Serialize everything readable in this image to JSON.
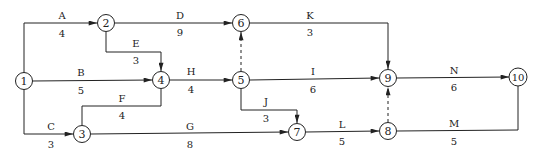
{
  "diagram": {
    "type": "activity-on-arrow network",
    "nodes": [
      {
        "id": "1",
        "x": 24,
        "y": 81
      },
      {
        "id": "2",
        "x": 106,
        "y": 23
      },
      {
        "id": "3",
        "x": 82,
        "y": 134
      },
      {
        "id": "4",
        "x": 161,
        "y": 80
      },
      {
        "id": "5",
        "x": 241,
        "y": 80
      },
      {
        "id": "6",
        "x": 241,
        "y": 23
      },
      {
        "id": "7",
        "x": 297,
        "y": 132
      },
      {
        "id": "8",
        "x": 388,
        "y": 131
      },
      {
        "id": "9",
        "x": 388,
        "y": 78
      },
      {
        "id": "10",
        "x": 518,
        "y": 77
      }
    ],
    "activities": [
      {
        "name": "A",
        "duration": "4",
        "from": "1",
        "to": "2"
      },
      {
        "name": "B",
        "duration": "5",
        "from": "1",
        "to": "4"
      },
      {
        "name": "C",
        "duration": "3",
        "from": "1",
        "to": "3"
      },
      {
        "name": "D",
        "duration": "9",
        "from": "2",
        "to": "6"
      },
      {
        "name": "E",
        "duration": "3",
        "from": "2",
        "to": "4"
      },
      {
        "name": "F",
        "duration": "4",
        "from": "3",
        "to": "4"
      },
      {
        "name": "G",
        "duration": "8",
        "from": "3",
        "to": "7"
      },
      {
        "name": "H",
        "duration": "4",
        "from": "4",
        "to": "5"
      },
      {
        "name": "I",
        "duration": "6",
        "from": "5",
        "to": "9"
      },
      {
        "name": "J",
        "duration": "3",
        "from": "5",
        "to": "7"
      },
      {
        "name": "K",
        "duration": "3",
        "from": "6",
        "to": "9"
      },
      {
        "name": "L",
        "duration": "5",
        "from": "7",
        "to": "8"
      },
      {
        "name": "M",
        "duration": "5",
        "from": "8",
        "to": "10"
      },
      {
        "name": "N",
        "duration": "6",
        "from": "9",
        "to": "10"
      }
    ],
    "dummy_activities": [
      {
        "from": "5",
        "to": "6"
      },
      {
        "from": "8",
        "to": "9"
      }
    ]
  }
}
